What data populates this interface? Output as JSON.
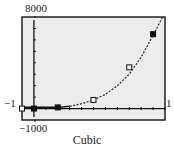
{
  "chart_data": {
    "type": "scatter",
    "title": "Cubic",
    "xlabel": "",
    "ylabel": "",
    "window_labels": {
      "ymax": "8000",
      "ymin": "−1000",
      "xmin": "−1",
      "xmax": "1"
    },
    "xlim": [
      -1,
      11
    ],
    "ylim": [
      -1000,
      8000
    ],
    "grid": false,
    "legend": null,
    "points": [
      {
        "x": -1,
        "y": 0,
        "marker": "open-square"
      },
      {
        "x": 0,
        "y": 0,
        "marker": "filled-square"
      },
      {
        "x": 2,
        "y": 100,
        "marker": "filled-square"
      },
      {
        "x": 5,
        "y": 750,
        "marker": "open-square"
      },
      {
        "x": 8,
        "y": 3600,
        "marker": "open-square"
      },
      {
        "x": 10,
        "y": 6500,
        "marker": "filled-square"
      }
    ],
    "series": [
      {
        "name": "Cubic regression curve",
        "style": "dashed",
        "x": [
          3,
          4,
          5,
          6,
          7,
          8,
          9,
          10,
          10.8
        ],
        "y": [
          200,
          420,
          750,
          1250,
          2000,
          3000,
          4500,
          6400,
          8000
        ]
      }
    ],
    "x_ticks_count": 11,
    "y_ticks_count": 8
  }
}
